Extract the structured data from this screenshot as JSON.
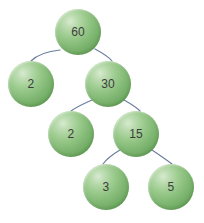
{
  "figure": {
    "kind": "binary-tree-diagram",
    "background_color": "#ffffff",
    "width": 204,
    "height": 223
  },
  "style": {
    "node_fill_highlight": "#d8ead0",
    "node_fill_mid": "#82b975",
    "node_fill_edge": "#5e9a53",
    "node_label_color": "#3c3c3c",
    "edge_color": "#6b7f9e",
    "edge_width": 1.2
  },
  "chart_data": {
    "type": "diagram",
    "nodes": [
      {
        "id": "n0",
        "label": "60",
        "cx": 78,
        "cy": 32,
        "r": 23,
        "level": 0
      },
      {
        "id": "n1",
        "label": "2",
        "cx": 31,
        "cy": 84,
        "r": 23,
        "level": 1
      },
      {
        "id": "n2",
        "label": "30",
        "cx": 108,
        "cy": 84,
        "r": 23,
        "level": 1
      },
      {
        "id": "n3",
        "label": "2",
        "cx": 71,
        "cy": 134,
        "r": 23,
        "level": 2
      },
      {
        "id": "n4",
        "label": "15",
        "cx": 136,
        "cy": 134,
        "r": 23,
        "level": 2
      },
      {
        "id": "n5",
        "label": "3",
        "cx": 106,
        "cy": 187,
        "r": 23,
        "level": 3
      },
      {
        "id": "n6",
        "label": "5",
        "cx": 171,
        "cy": 187,
        "r": 23,
        "level": 3
      }
    ],
    "edges": [
      {
        "from": "n0",
        "to": "n1",
        "path": "M 60 50 Q 40 52 31 61"
      },
      {
        "from": "n0",
        "to": "n2",
        "path": "M 95 49 Q 108 56 112 61"
      },
      {
        "from": "n2",
        "to": "n3",
        "path": "M 92 100 Q 78 106 71 111"
      },
      {
        "from": "n2",
        "to": "n4",
        "path": "M 124 100 Q 135 106 140 111"
      },
      {
        "from": "n4",
        "to": "n5",
        "path": "M 120 150 Q 108 157 103 164"
      },
      {
        "from": "n4",
        "to": "n6",
        "path": "M 152 150 Q 164 158 172 164"
      }
    ]
  }
}
